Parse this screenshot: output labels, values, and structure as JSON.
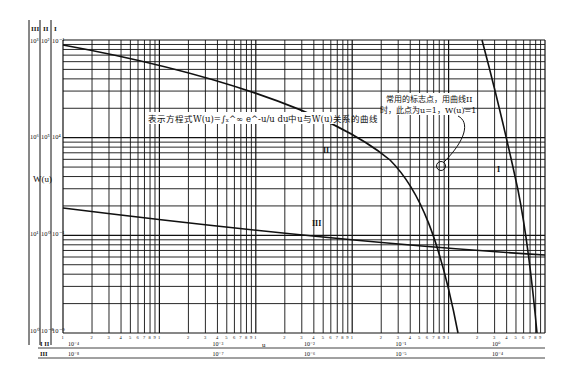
{
  "chart_data": {
    "type": "line",
    "title": "表示方程式W(u)=∫ₓ^∞ e^-u/u du中u与W(u)关系的曲线",
    "annotation": {
      "line1": "常用的标志点，用曲线II",
      "line2": "时，此点为u=1，W(u)=1",
      "marker_u": 1,
      "marker_W": 1
    },
    "ylabel": "W(u)",
    "xlabel": "u",
    "scale": "log-log",
    "grid": true,
    "y_axis_columns": [
      {
        "name": "III",
        "ticks": [
          "10³",
          "10²",
          "10¹",
          "10⁰"
        ]
      },
      {
        "name": "II",
        "ticks": [
          "10²",
          "10⁵",
          "10⁻¹",
          "10⁻⁸"
        ]
      },
      {
        "name": "I",
        "ticks": [
          "10⁻¹",
          "10⁴",
          "10⁻³",
          "10⁻⁹"
        ]
      }
    ],
    "y_axis_header": {
      "III": "III",
      "II": "II",
      "I": "I",
      "top_III": "10³",
      "top_II": "10²",
      "top_I": "10⁻¹"
    },
    "y_axis_rows": [
      {
        "III": "10³",
        "II": "10²",
        "I": "10⁻¹"
      },
      {
        "III": "10⁶",
        "II": "10⁵",
        "I": "10⁴"
      },
      {
        "III": "10¹",
        "II": "10⁰",
        "I": "10⁻¹"
      },
      {
        "III": "10⁰",
        "II": "10⁻⁸",
        "I": "10⁻⁹"
      }
    ],
    "x_minor_ticks": [
      "1",
      "2",
      "3",
      "4",
      "5",
      "6",
      "7",
      "8",
      "9",
      "1"
    ],
    "x_axis_rows": [
      {
        "name": "I II",
        "ticks": [
          "10⁻⁴",
          "10⁻³",
          "10⁻²",
          "u",
          "10⁻¹",
          "10⁰"
        ]
      },
      {
        "name": "III",
        "ticks": [
          "10⁻⁸",
          "10⁻⁷",
          "10⁻⁶",
          "10⁻⁵",
          "10⁻⁴"
        ]
      }
    ],
    "series": [
      {
        "name": "I",
        "description": "steep curve on right side, W(u) from ~10 down to ~0.01 over u in 10⁻¹–10⁰ decade",
        "label_position": "right"
      },
      {
        "name": "II",
        "description": "gently declining curve from top-left, steepening sharply near u≈1",
        "label_position": "upper middle"
      },
      {
        "name": "III",
        "description": "nearly straight declining line from left middle to lower right",
        "label_position": "middle"
      }
    ],
    "plot_decades_x": 5,
    "plot_decades_y": 3
  },
  "labels": {
    "curve_I": "I",
    "curve_II": "II",
    "curve_III": "III",
    "y_title": "W(u)",
    "x_u": "u",
    "col_III": "III",
    "col_II": "II",
    "col_I": "I",
    "row_I_II": "I II",
    "row_III": "III"
  }
}
